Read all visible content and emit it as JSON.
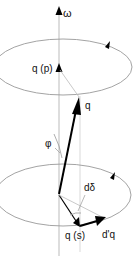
{
  "diagram": {
    "labels": {
      "omega": "ω",
      "q_p": "q (p)",
      "q": "q",
      "phi": "φ",
      "d_delta": "dδ",
      "q_s": "q (s)",
      "d_prime_q": "d'q"
    },
    "colors": {
      "line": "#999999",
      "thick": "#000000",
      "text": "#111111"
    }
  }
}
